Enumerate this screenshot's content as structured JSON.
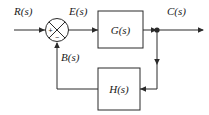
{
  "diagram": {
    "type": "control-system-block-diagram",
    "background_color": "#ffffff",
    "line_color": "#2b2b2b",
    "signals": {
      "input": "R(s)",
      "error": "E(s)",
      "output": "C(s)",
      "feedback": "B(s)"
    },
    "blocks": [
      {
        "id": "forward",
        "label": "G(s)"
      },
      {
        "id": "feedback",
        "label": "H(s)"
      }
    ],
    "summing_junction": {
      "input_sign": "+",
      "feedback_sign": "−"
    }
  }
}
